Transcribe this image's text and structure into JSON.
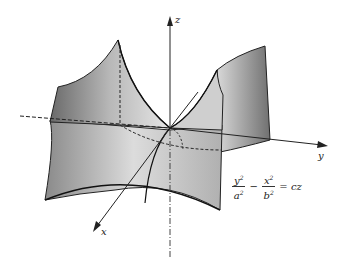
{
  "figure": {
    "axes": {
      "x": "x",
      "y": "y",
      "z": "z"
    },
    "equation": {
      "term1_num": "y",
      "term1_den": "a",
      "operator": "−",
      "term2_num": "x",
      "term2_den": "b",
      "exponent": "2",
      "rhs": "= cz"
    }
  }
}
